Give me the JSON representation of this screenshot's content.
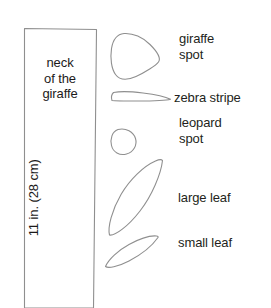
{
  "page": {
    "background_color": "#ffffff",
    "outline_color": "#8c8c8c",
    "text_color": "#231f20",
    "width": 271,
    "height": 308
  },
  "pattern_piece": {
    "name": "neck of the giraffe",
    "label_line_1": "neck",
    "label_line_2": "of the",
    "label_line_3": "giraffe",
    "dimension_label": "11 in. (28 cm)",
    "dimension_inches": 11,
    "dimension_cm": 28
  },
  "shapes": [
    {
      "id": "giraffe-spot",
      "label_line_1": "giraffe",
      "label_line_2": "spot",
      "label": "giraffe spot"
    },
    {
      "id": "zebra-stripe",
      "label_line_1": "zebra stripe",
      "label_line_2": "",
      "label": "zebra stripe"
    },
    {
      "id": "leopard-spot",
      "label_line_1": "leopard",
      "label_line_2": "spot",
      "label": "leopard spot"
    },
    {
      "id": "large-leaf",
      "label_line_1": "large leaf",
      "label_line_2": "",
      "label": "large leaf"
    },
    {
      "id": "small-leaf",
      "label_line_1": "small leaf",
      "label_line_2": "",
      "label": "small leaf"
    }
  ]
}
